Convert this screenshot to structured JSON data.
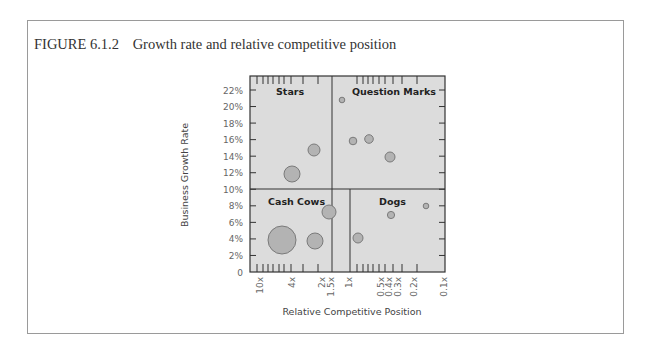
{
  "figure": {
    "number": "FIGURE 6.1.2",
    "caption": "Growth rate and relative competitive position"
  },
  "chart_data": {
    "type": "scatter",
    "subtype": "bubble",
    "title": "Growth rate and relative competitive position",
    "xlabel": "Relative Competitive Position",
    "ylabel": "Business Growth Rate",
    "x_scale": "log, reversed",
    "x_tick_labels": [
      "10x",
      "4x",
      "2x",
      "1.5x",
      "1x",
      "0.5x",
      "0.4x",
      "0.3x",
      "0.2x",
      "0.1x"
    ],
    "y_tick_labels": [
      "0",
      "2%",
      "4%",
      "6%",
      "8%",
      "10%",
      "12%",
      "14%",
      "16%",
      "18%",
      "20%",
      "22%"
    ],
    "ylim": [
      0,
      22
    ],
    "xlim": [
      "10x",
      "0.1x"
    ],
    "grid": false,
    "quadrants": [
      {
        "label": "Stars",
        "position": "top-left"
      },
      {
        "label": "Question Marks",
        "position": "top-right"
      },
      {
        "label": "Cash Cows",
        "position": "bottom-left"
      },
      {
        "label": "Dogs",
        "position": "bottom-right"
      }
    ],
    "dividers": {
      "y": 10,
      "x_top": "1.5x",
      "x_bottom": "1x"
    },
    "series": [
      {
        "name": "Stars",
        "points": [
          {
            "x": 3.5,
            "y": 12,
            "size": "medium"
          },
          {
            "x": 2.2,
            "y": 15,
            "size": "small"
          }
        ]
      },
      {
        "name": "Question Marks",
        "points": [
          {
            "x": 1.1,
            "y": 21,
            "size": "tiny"
          },
          {
            "x": 0.8,
            "y": 16,
            "size": "tiny"
          },
          {
            "x": 0.6,
            "y": 16.2,
            "size": "small"
          },
          {
            "x": 0.4,
            "y": 14,
            "size": "small"
          }
        ]
      },
      {
        "name": "Cash Cows",
        "points": [
          {
            "x": 6,
            "y": 4,
            "size": "large"
          },
          {
            "x": 2.2,
            "y": 3.8,
            "size": "medium"
          },
          {
            "x": 1.6,
            "y": 7.3,
            "size": "medium"
          }
        ]
      },
      {
        "name": "Dogs",
        "points": [
          {
            "x": 0.9,
            "y": 4.2,
            "size": "small"
          },
          {
            "x": 0.4,
            "y": 7,
            "size": "tiny"
          },
          {
            "x": 0.15,
            "y": 8.2,
            "size": "tiny"
          }
        ]
      }
    ],
    "bubbles_px": [
      {
        "cx": 292,
        "cy": 174,
        "r": 8
      },
      {
        "cx": 314,
        "cy": 150,
        "r": 6
      },
      {
        "cx": 342,
        "cy": 100,
        "r": 2.8
      },
      {
        "cx": 353,
        "cy": 141,
        "r": 3.8
      },
      {
        "cx": 369,
        "cy": 139,
        "r": 4.3
      },
      {
        "cx": 390,
        "cy": 157,
        "r": 5
      },
      {
        "cx": 282,
        "cy": 240,
        "r": 14
      },
      {
        "cx": 315,
        "cy": 241,
        "r": 8
      },
      {
        "cx": 329,
        "cy": 212,
        "r": 7
      },
      {
        "cx": 358,
        "cy": 238,
        "r": 5
      },
      {
        "cx": 391,
        "cy": 215,
        "r": 3.6
      },
      {
        "cx": 426,
        "cy": 206,
        "r": 2.8
      }
    ],
    "colors": {
      "plot_bg": "#dcdcdc",
      "bubble_fill": "#b3b3b3",
      "bubble_stroke": "#7a7a7a",
      "axis": "#333333",
      "tick_label": "#666666"
    }
  }
}
